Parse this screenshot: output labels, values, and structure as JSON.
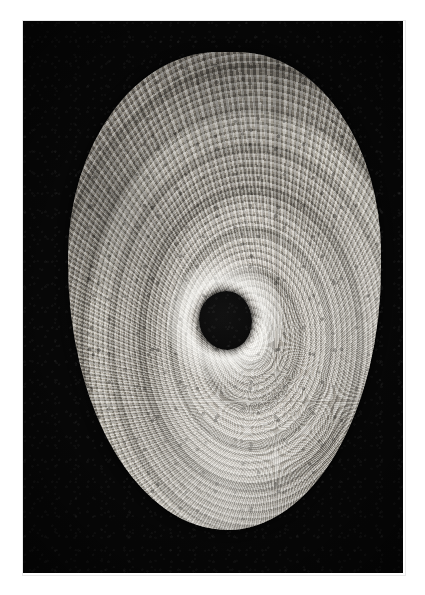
{
  "page": {
    "background_color": "#ffffff",
    "width_px": 425,
    "height_px": 595,
    "caption": ""
  },
  "plate": {
    "name": "photographic-plate",
    "background_color": "#070707",
    "left_px": 23,
    "top_px": 21,
    "width_px": 380,
    "height_px": 552,
    "border_color": "#e9e9e9",
    "alt_text": "Black-and-white photomicrograph of a fish otolith showing concentric growth rings around a dark nucleus"
  },
  "specimen": {
    "name": "otolith-specimen",
    "shape": "rounded-oval-disc",
    "left_px": 68,
    "top_px": 52,
    "width_px": 313,
    "height_px": 478,
    "base_color": "#c4bfb7",
    "light_zone_color": "#d8d4cd",
    "dark_zone_color": "#8d8880",
    "margin": "crenulated",
    "features": [
      "radial-ribs",
      "concentric-annuli",
      "seasonal-zones",
      "dark-speckle-mottling",
      "bright-marginal-band"
    ]
  },
  "nucleus": {
    "name": "nucleus-core",
    "center_x_px": 225,
    "center_y_px": 320,
    "width_px": 53,
    "height_px": 59,
    "color": "#060606",
    "halo_color": "#fffffc"
  },
  "labels": {
    "figure_caption": "",
    "scale_bar": "",
    "annotations": []
  }
}
